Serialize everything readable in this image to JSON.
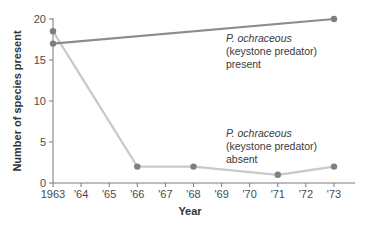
{
  "chart_data": {
    "type": "line",
    "title": "",
    "xlabel": "Year",
    "ylabel": "Number of species present",
    "x": [
      1963,
      1964,
      1965,
      1966,
      1967,
      1968,
      1969,
      1970,
      1971,
      1972,
      1973
    ],
    "x_tick_labels": [
      "1963",
      "'64",
      "'65",
      "'66",
      "'67",
      "'68",
      "'69",
      "'70",
      "'71",
      "'72",
      "'73"
    ],
    "y_ticks": [
      0,
      5,
      10,
      15,
      20
    ],
    "ylim": [
      0,
      20
    ],
    "grid": false,
    "legend": "inline annotations",
    "series": [
      {
        "name": "P. ochraceous (keystone predator) present",
        "color": "#8c8c8c",
        "points": [
          {
            "x": 1963,
            "y": 17
          },
          {
            "x": 1973,
            "y": 20
          }
        ]
      },
      {
        "name": "P. ochraceous (keystone predator) absent",
        "color": "#c9c9c9",
        "points": [
          {
            "x": 1963,
            "y": 18.5
          },
          {
            "x": 1966,
            "y": 2
          },
          {
            "x": 1968,
            "y": 2
          },
          {
            "x": 1971,
            "y": 1
          },
          {
            "x": 1973,
            "y": 2
          }
        ]
      }
    ],
    "annotations": [
      {
        "lines": [
          "P. ochraceous",
          "(keystone predator)",
          "present"
        ],
        "italic_first_line": true
      },
      {
        "lines": [
          "P. ochraceous",
          "(keystone predator)",
          "absent"
        ],
        "italic_first_line": true
      }
    ]
  },
  "labels": {
    "y_axis_title": "Number of species present",
    "x_axis_title": "Year",
    "present_line1": "P. ochraceous",
    "present_line2": "(keystone predator)",
    "present_line3": "present",
    "absent_line1": "P. ochraceous",
    "absent_line2": "(keystone predator)",
    "absent_line3": "absent"
  },
  "colors": {
    "axis": "#7a7a7a",
    "marker": "#7f7f7f"
  }
}
